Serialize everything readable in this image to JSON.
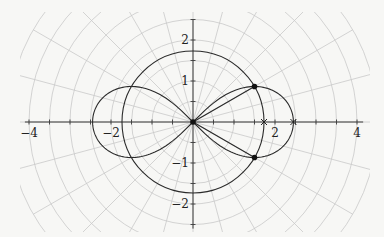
{
  "figure": {
    "origin_px": [
      193,
      122
    ],
    "scale_px_per_unit": 41,
    "colors": {
      "background": "#f7f7f5",
      "grid": "#c9c9c9",
      "axes": "#3a3a3a",
      "curves": "#2a2a2a"
    }
  },
  "axes": {
    "x_labels": [
      {
        "value": -4,
        "text": "−4"
      },
      {
        "value": -2,
        "text": "−2"
      },
      {
        "value": 2,
        "text": "2"
      },
      {
        "value": 4,
        "text": "4"
      }
    ],
    "y_labels": [
      {
        "value": 2,
        "text": "2"
      },
      {
        "value": 1,
        "text": "1"
      },
      {
        "value": -1,
        "text": "−1"
      },
      {
        "value": -2,
        "text": "−2"
      }
    ],
    "x_range": [
      -4.1,
      4.15
    ],
    "y_range": [
      -2.6,
      2.5
    ],
    "tick_step": 0.5
  },
  "grid": {
    "type": "polar",
    "radial_step": 0.5,
    "max_radius": 4.5,
    "angle_step_deg": 15
  },
  "chart_data": {
    "type": "diagram",
    "curves": [
      {
        "name": "circle",
        "equation": "r = sqrt(3)",
        "radius": 1.732
      },
      {
        "name": "lemniscate",
        "equation": "r^2 = 6 cos(2θ)",
        "a": 2.449
      }
    ],
    "points": [
      {
        "label": "intersection-upper",
        "x": 1.5,
        "y": 0.866,
        "marker": "dot"
      },
      {
        "label": "intersection-lower",
        "x": 1.5,
        "y": -0.866,
        "marker": "dot"
      },
      {
        "label": "origin",
        "x": 0,
        "y": 0,
        "marker": "dot"
      }
    ],
    "x_axis_markers": [
      {
        "label": "sqrt3",
        "x": 1.732,
        "marker": "cross"
      },
      {
        "label": "sqrt6",
        "x": 2.449,
        "marker": "cross"
      }
    ],
    "segments": [
      {
        "from": [
          0,
          0
        ],
        "to": [
          1.5,
          0.866
        ]
      },
      {
        "from": [
          0,
          0
        ],
        "to": [
          1.5,
          -0.866
        ]
      }
    ]
  }
}
